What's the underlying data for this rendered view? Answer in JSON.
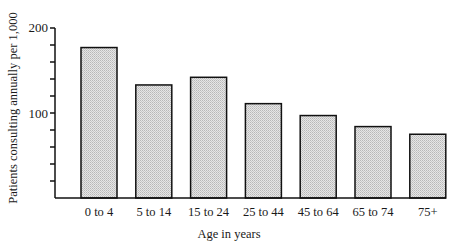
{
  "chart_data": {
    "type": "bar",
    "title": "",
    "xlabel": "Age in years",
    "ylabel": "Patients consulting annually per 1,000",
    "categories": [
      "0 to 4",
      "5 to 14",
      "15 to 24",
      "25 to 44",
      "45 to 64",
      "65 to 74",
      "75+"
    ],
    "values": [
      177,
      133,
      142,
      111,
      97,
      84,
      75
    ],
    "ylim": [
      0,
      200
    ],
    "yticks_labeled": [
      100,
      200
    ],
    "yticks_minor_interval": 20,
    "grid": false,
    "legend": null,
    "bar_fill": "#d9d9d9",
    "bar_stroke": "#111111"
  },
  "axes": {
    "ylabel": "Patients consulting annually per 1,000",
    "xlabel": "Age in years",
    "ytick_labels": [
      "100",
      "200"
    ]
  }
}
